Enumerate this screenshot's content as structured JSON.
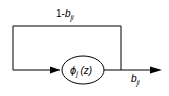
{
  "diagram": {
    "feedback_label": {
      "prefix": "1-",
      "var": "b",
      "sub": "ji"
    },
    "node_label": {
      "var": "ϕ",
      "sub": "j",
      "arg": " (z)"
    },
    "output_label": {
      "var": "b",
      "sub": "ji"
    },
    "colors": {
      "stroke": "#000000",
      "background": "#ffffff"
    }
  }
}
